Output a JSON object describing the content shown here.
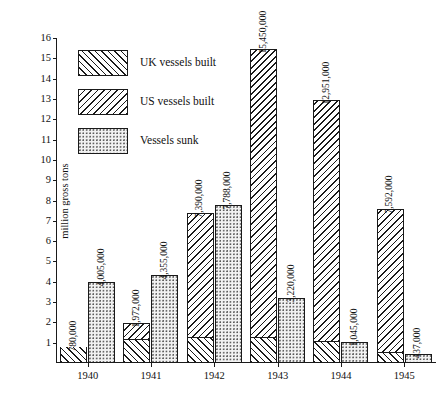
{
  "chart_data": {
    "type": "bar",
    "title": "",
    "subtitle": "",
    "xlabel": "",
    "ylabel": "million gross tons",
    "ylim": [
      0,
      16
    ],
    "y_unit": "million gross tons",
    "grid": false,
    "stacked_built_bar": true,
    "legend_position": "inside-top-left",
    "categories": [
      "1940",
      "1941",
      "1942",
      "1943",
      "1944",
      "1945"
    ],
    "yticks": [
      1,
      2,
      3,
      4,
      5,
      6,
      7,
      8,
      9,
      10,
      11,
      12,
      13,
      14,
      15,
      16
    ],
    "ytick_labels": [
      "1",
      "2",
      "3",
      "4",
      "5",
      "6",
      "7",
      "8",
      "9",
      "10",
      "11",
      "12",
      "13",
      "14",
      "15",
      "16"
    ],
    "series": [
      {
        "name": "UK vessels built",
        "pattern": "forward-hatch",
        "values": [
          780000,
          1200000,
          1300000,
          1300000,
          1100000,
          550000
        ]
      },
      {
        "name": "US vessels built",
        "pattern": "back-hatch",
        "values": [
          0,
          772000,
          6090000,
          14150000,
          11851000,
          7042000
        ]
      },
      {
        "name": "Vessels built (total)",
        "pattern": "combined",
        "values": [
          780000,
          1972000,
          7390000,
          15450000,
          12951000,
          7592000
        ],
        "data_labels": [
          "780,000",
          "1,972,000",
          "7,390,000",
          "15,450,000",
          "12,951,000",
          "7,592,000"
        ]
      },
      {
        "name": "Vessels sunk",
        "pattern": "dotted",
        "values": [
          4005000,
          4355000,
          7788000,
          3220000,
          1045000,
          437000
        ],
        "data_labels": [
          "4,005,000",
          "4,355,000",
          "7,788,000",
          "3,220,000",
          "1,045,000",
          "437,000"
        ]
      }
    ],
    "annotations": [
      "780,000",
      "4,005,000",
      "1,972,000",
      "4,355,000",
      "7,390,000",
      "7,788,000",
      "15,450,000",
      "3,220,000",
      "12,951,000",
      "1,045,000",
      "7,592,000",
      "437,000"
    ]
  },
  "legend": {
    "items": [
      {
        "label": "UK vessels built",
        "swatch": "forward-hatch-swatch"
      },
      {
        "label": "US vessels built",
        "swatch": "back-hatch-swatch"
      },
      {
        "label": "Vessels sunk",
        "swatch": "dotted-swatch"
      }
    ]
  },
  "axes": {
    "y_title": "million gross tons",
    "y_ticks": [
      "16",
      "15",
      "14",
      "13",
      "12",
      "11",
      "10",
      "9",
      "8",
      "7",
      "6",
      "5",
      "4",
      "3",
      "2",
      "1"
    ],
    "x_ticks": [
      "1940",
      "1941",
      "1942",
      "1943",
      "1944",
      "1945"
    ]
  },
  "bars": [
    {
      "year": "1940",
      "built_label": "780,000",
      "sunk_label": "4,005,000",
      "uk": 780000,
      "us": 0,
      "total": 780000,
      "sunk": 4005000
    },
    {
      "year": "1941",
      "built_label": "1,972,000",
      "sunk_label": "4,355,000",
      "uk": 1200000,
      "us": 772000,
      "total": 1972000,
      "sunk": 4355000
    },
    {
      "year": "1942",
      "built_label": "7,390,000",
      "sunk_label": "7,788,000",
      "uk": 1300000,
      "us": 6090000,
      "total": 7390000,
      "sunk": 7788000
    },
    {
      "year": "1943",
      "built_label": "15,450,000",
      "sunk_label": "3,220,000",
      "uk": 1300000,
      "us": 14150000,
      "total": 15450000,
      "sunk": 3220000
    },
    {
      "year": "1944",
      "built_label": "12,951,000",
      "sunk_label": "1,045,000",
      "uk": 1100000,
      "us": 11851000,
      "total": 12951000,
      "sunk": 1045000
    },
    {
      "year": "1945",
      "built_label": "7,592,000",
      "sunk_label": "437,000",
      "uk": 550000,
      "us": 7042000,
      "total": 7592000,
      "sunk": 437000
    }
  ],
  "colors": {
    "ink": "#1a1a1a",
    "background": "#ffffff",
    "dot_fill": "#f2f2f2"
  }
}
